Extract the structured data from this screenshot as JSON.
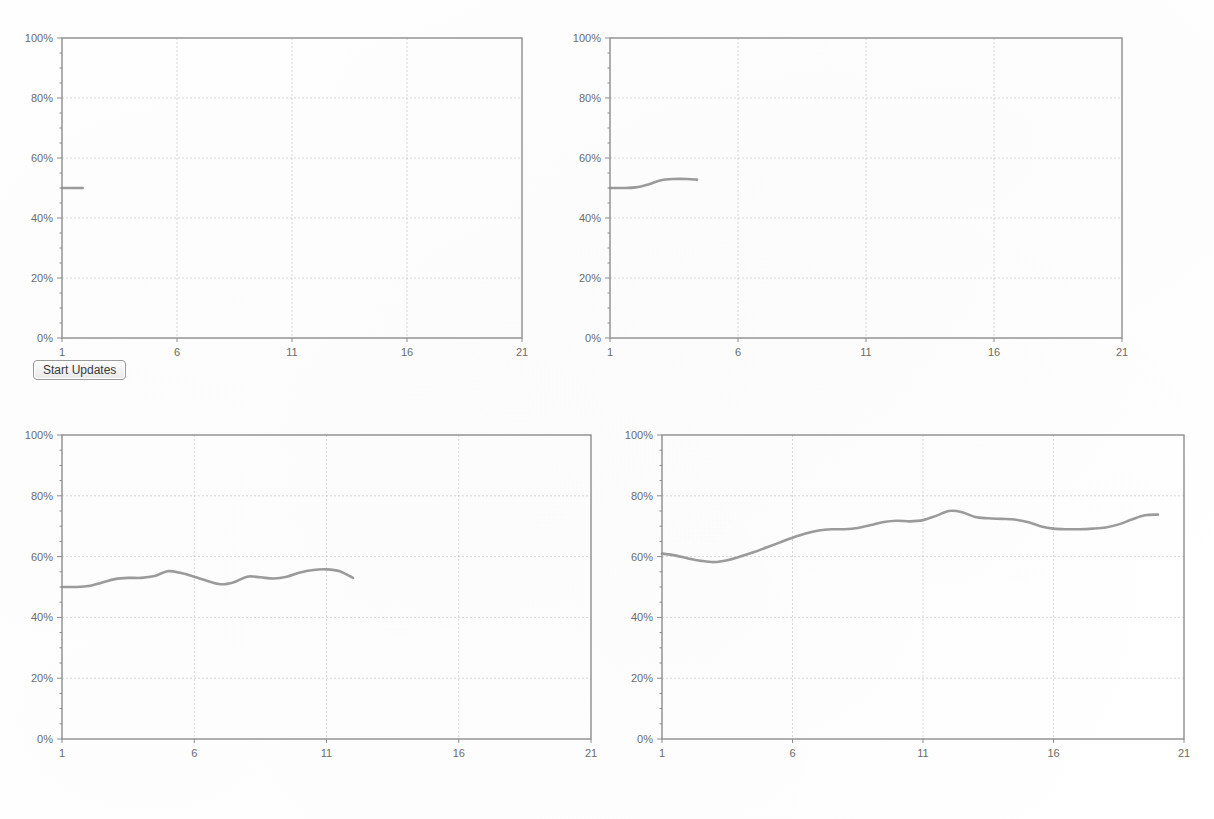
{
  "app": {
    "background_color": "#ffffff",
    "line_color": "#8d8d8d",
    "grid_color": "#cfcfcf",
    "axis_color": "#8d8d8d"
  },
  "controls": {
    "start_updates_label": "Start Updates"
  },
  "chart_data": [
    {
      "id": "chart-top-left",
      "type": "line",
      "title": "",
      "xlabel": "",
      "ylabel": "",
      "xlim": [
        1,
        21
      ],
      "ylim": [
        0,
        100
      ],
      "grid": true,
      "legend": null,
      "xticks": [
        1,
        6,
        11,
        16,
        21
      ],
      "xtick_labels": [
        "1",
        "6",
        "11",
        "16",
        "21"
      ],
      "yticks": [
        0,
        20,
        40,
        60,
        80,
        100
      ],
      "ytick_labels": [
        "0%",
        "20%",
        "40%",
        "60%",
        "80%",
        "100%"
      ],
      "series": [
        {
          "name": "cpu",
          "x": [
            1,
            1.4,
            1.9
          ],
          "values": [
            50,
            50,
            50
          ]
        }
      ]
    },
    {
      "id": "chart-top-right",
      "type": "line",
      "title": "",
      "xlabel": "",
      "ylabel": "",
      "xlim": [
        1,
        21
      ],
      "ylim": [
        0,
        100
      ],
      "grid": true,
      "legend": null,
      "xticks": [
        1,
        6,
        11,
        16,
        21
      ],
      "xtick_labels": [
        "1",
        "6",
        "11",
        "16",
        "21"
      ],
      "yticks": [
        0,
        20,
        40,
        60,
        80,
        100
      ],
      "ytick_labels": [
        "0%",
        "20%",
        "40%",
        "60%",
        "80%",
        "100%"
      ],
      "series": [
        {
          "name": "cpu",
          "x": [
            1,
            1.5,
            2,
            2.5,
            3,
            3.5,
            4,
            4.4
          ],
          "values": [
            50,
            50,
            50.2,
            51.2,
            52.6,
            53,
            53,
            52.8
          ]
        }
      ]
    },
    {
      "id": "chart-bottom-left",
      "type": "line",
      "title": "",
      "xlabel": "",
      "ylabel": "",
      "xlim": [
        1,
        21
      ],
      "ylim": [
        0,
        100
      ],
      "grid": true,
      "legend": null,
      "xticks": [
        1,
        6,
        11,
        16,
        21
      ],
      "xtick_labels": [
        "1",
        "6",
        "11",
        "16",
        "21"
      ],
      "yticks": [
        0,
        20,
        40,
        60,
        80,
        100
      ],
      "ytick_labels": [
        "0%",
        "20%",
        "40%",
        "60%",
        "80%",
        "100%"
      ],
      "series": [
        {
          "name": "cpu",
          "x": [
            1,
            1.5,
            2,
            2.5,
            3,
            3.5,
            4,
            4.5,
            5,
            5.5,
            6,
            6.5,
            7,
            7.5,
            8,
            8.5,
            9,
            9.5,
            10,
            10.5,
            11,
            11.5,
            12
          ],
          "values": [
            50,
            50,
            50.3,
            51.4,
            52.6,
            53,
            53,
            53.6,
            55.2,
            54.6,
            53.4,
            52,
            50.9,
            51.6,
            53.4,
            53.2,
            52.8,
            53.4,
            54.8,
            55.6,
            55.8,
            55.2,
            53
          ]
        }
      ]
    },
    {
      "id": "chart-bottom-right",
      "type": "line",
      "title": "",
      "xlabel": "",
      "ylabel": "",
      "xlim": [
        1,
        21
      ],
      "ylim": [
        0,
        100
      ],
      "grid": true,
      "legend": null,
      "xticks": [
        1,
        6,
        11,
        16,
        21
      ],
      "xtick_labels": [
        "1",
        "6",
        "11",
        "16",
        "21"
      ],
      "yticks": [
        0,
        20,
        40,
        60,
        80,
        100
      ],
      "ytick_labels": [
        "0%",
        "20%",
        "40%",
        "60%",
        "80%",
        "100%"
      ],
      "series": [
        {
          "name": "cpu",
          "x": [
            1,
            1.5,
            2,
            2.5,
            3,
            3.5,
            4,
            4.5,
            5,
            5.5,
            6,
            6.5,
            7,
            7.5,
            8,
            8.5,
            9,
            9.5,
            10,
            10.5,
            11,
            11.5,
            12,
            12.5,
            13,
            13.5,
            14,
            14.5,
            15,
            15.5,
            16,
            16.5,
            17,
            17.5,
            18,
            18.5,
            19,
            19.5,
            20
          ],
          "values": [
            61,
            60.4,
            59.4,
            58.6,
            58.2,
            58.8,
            60,
            61.4,
            63,
            64.6,
            66.2,
            67.6,
            68.6,
            69,
            69,
            69.4,
            70.4,
            71.4,
            71.8,
            71.6,
            72,
            73.4,
            75,
            74.6,
            73,
            72.6,
            72.4,
            72.2,
            71.4,
            70,
            69.2,
            69,
            69,
            69.2,
            69.6,
            70.6,
            72.2,
            73.6,
            73.8
          ]
        }
      ]
    }
  ]
}
